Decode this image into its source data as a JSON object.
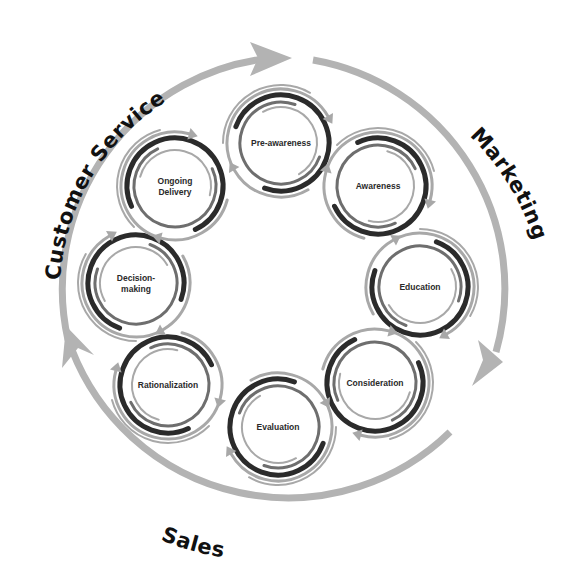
{
  "diagram": {
    "type": "cycle",
    "colors": {
      "outer_arc": "#b3b3b3",
      "swirl_dark": "#2b2b2b",
      "swirl_mid": "#6e6e6e",
      "swirl_light": "#a8a8a8",
      "label": "#2a2a2a",
      "phase_label": "#111111",
      "background": "#ffffff"
    },
    "phases": [
      {
        "id": "customer-service",
        "label": "Customer Service"
      },
      {
        "id": "marketing",
        "label": "Marketing"
      },
      {
        "id": "sales",
        "label": "Sales"
      }
    ],
    "stages": [
      {
        "id": "pre-awareness",
        "lines": [
          "Pre-awareness"
        ]
      },
      {
        "id": "awareness",
        "lines": [
          "Awareness"
        ]
      },
      {
        "id": "education",
        "lines": [
          "Education"
        ]
      },
      {
        "id": "consideration",
        "lines": [
          "Consideration"
        ]
      },
      {
        "id": "evaluation",
        "lines": [
          "Evaluation"
        ]
      },
      {
        "id": "rationalization",
        "lines": [
          "Rationalization"
        ]
      },
      {
        "id": "decision-making",
        "lines": [
          "Decision-",
          "making"
        ]
      },
      {
        "id": "ongoing-delivery",
        "lines": [
          "Ongoing",
          "Delivery"
        ]
      }
    ]
  }
}
